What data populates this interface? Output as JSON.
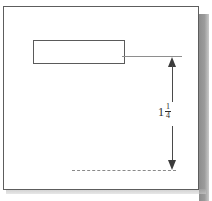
{
  "drawing": {
    "kind": "engineering-dimension-sketch",
    "background_color": "#ffffff",
    "line_color": "#5a5a5a",
    "frame": {
      "name": "drawing-frame",
      "border_color": "#5d5d5d"
    },
    "part": {
      "name": "part-rectangle",
      "shape": "rectangle",
      "fill": "none",
      "outline_color": "#5a5a5a"
    },
    "extension_lines": {
      "upper": {
        "style": "solid",
        "color": "#8e8e8e"
      },
      "lower": {
        "style": "dashed",
        "color": "#8a8a8a"
      }
    },
    "dimension": {
      "name": "vertical-dimension",
      "orientation": "vertical",
      "arrowheads": "both-ends",
      "arrow_color": "#3c3c3c",
      "value_text": "1 1/4",
      "whole_number": "1",
      "numerator": "1",
      "denominator": "4",
      "units": ""
    },
    "scan_shadow": {
      "right_color": "#8d8d8d",
      "bottom_color": "#a8a8a8"
    }
  }
}
